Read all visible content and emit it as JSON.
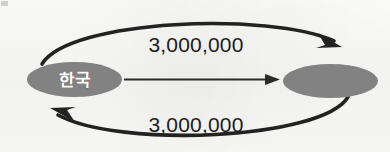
{
  "diagram": {
    "type": "directed-graph",
    "background_color": "#fbfbfa",
    "node_fill_color": "#828282",
    "edge_color": "#1f1f1f",
    "label_text_color": "#1c1c1c",
    "node_text_color": "#ffffff",
    "nodes": [
      {
        "id": "korea",
        "label": "한국",
        "has_label": true,
        "cx": 74.5,
        "cy": 79.5,
        "rx": 47.5,
        "ry": 17.5
      },
      {
        "id": "partner",
        "label": "",
        "has_label": false,
        "cx": 330.5,
        "cy": 81,
        "rx": 47.5,
        "ry": 17
      }
    ],
    "edges": [
      {
        "id": "edge-top",
        "from": "korea",
        "to": "partner",
        "value": "3,000,000",
        "shape": "curved-arc-above",
        "direction": "korea-to-partner",
        "label_x": 196,
        "label_y": 52
      },
      {
        "id": "edge-middle",
        "from": "korea",
        "to": "partner",
        "value": "",
        "shape": "straight",
        "direction": "korea-to-partner",
        "label_x": 0,
        "label_y": 0
      },
      {
        "id": "edge-bottom",
        "from": "partner",
        "to": "korea",
        "value": "3,000,000",
        "shape": "curved-arc-below",
        "direction": "partner-to-korea",
        "label_x": 196,
        "label_y": 132
      }
    ]
  }
}
